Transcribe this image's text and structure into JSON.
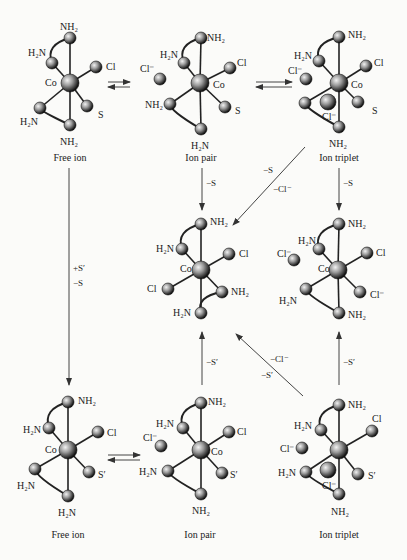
{
  "structures": [
    {
      "id": "top-free-ion",
      "caption": "Free ion",
      "cx": 70,
      "cy": 83,
      "atoms": [
        {
          "label": "NH₂",
          "x": 70,
          "y": 38,
          "lx": 60,
          "ly": 22
        },
        {
          "label": "H₂N",
          "x": 52,
          "y": 63,
          "lx": 28,
          "ly": 48
        },
        {
          "label": "Cl",
          "x": 96,
          "y": 67,
          "lx": 106,
          "ly": 62
        },
        {
          "label": "S",
          "x": 87,
          "y": 106,
          "lx": 98,
          "ly": 110
        },
        {
          "label": "H₂N",
          "x": 40,
          "y": 108,
          "lx": 20,
          "ly": 117
        },
        {
          "label": "NH₂",
          "x": 70,
          "y": 125,
          "lx": 60,
          "ly": 137
        }
      ],
      "center_label": {
        "text": "Co",
        "x": 45,
        "y": 78
      },
      "ion": null
    },
    {
      "id": "top-ion-pair",
      "caption": "Ion pair",
      "cx": 200,
      "cy": 83,
      "atoms": [
        {
          "label": "NH₂",
          "x": 201,
          "y": 38,
          "lx": 207,
          "ly": 33
        },
        {
          "label": "H₂N",
          "x": 184,
          "y": 63,
          "lx": 160,
          "ly": 50
        },
        {
          "label": "Cl",
          "x": 230,
          "y": 68,
          "lx": 237,
          "ly": 58
        },
        {
          "label": "S",
          "x": 225,
          "y": 107,
          "lx": 235,
          "ly": 106
        },
        {
          "label": "NH₂",
          "x": 170,
          "y": 104,
          "lx": 145,
          "ly": 100
        },
        {
          "label": "H₂N",
          "x": 201,
          "y": 129,
          "lx": 191,
          "ly": 141
        }
      ],
      "center_label": {
        "text": "Co",
        "x": 213,
        "y": 80
      },
      "ion": {
        "label": "Cl⁻",
        "x": 160,
        "y": 79,
        "lx": 140,
        "ly": 64
      }
    },
    {
      "id": "top-ion-triplet",
      "caption": "Ion triplet",
      "cx": 339,
      "cy": 83,
      "atoms": [
        {
          "label": "NH₂",
          "x": 339,
          "y": 37,
          "lx": 348,
          "ly": 30
        },
        {
          "label": "H₂N",
          "x": 319,
          "y": 61,
          "lx": 294,
          "ly": 51
        },
        {
          "label": "Cl",
          "x": 366,
          "y": 66,
          "lx": 374,
          "ly": 58
        },
        {
          "label": "S",
          "x": 358,
          "y": 102,
          "lx": 372,
          "ly": 106
        },
        {
          "label": "",
          "x": 305,
          "y": 103,
          "lx": 0,
          "ly": 0
        },
        {
          "label": "NH₂",
          "x": 339,
          "y": 127,
          "lx": 329,
          "ly": 139
        }
      ],
      "center_label": {
        "text": "Co",
        "x": 351,
        "y": 80
      },
      "ion": {
        "label": "Cl⁻",
        "x": 306,
        "y": 79,
        "lx": 288,
        "ly": 66
      },
      "ion2": {
        "label": "Cl⁻",
        "x": 328,
        "y": 102,
        "lx": 322,
        "ly": 112
      }
    },
    {
      "id": "middle-dichloro",
      "caption": "",
      "cx": 201,
      "cy": 270,
      "atoms": [
        {
          "label": "NH₂",
          "x": 201,
          "y": 224,
          "lx": 210,
          "ly": 217
        },
        {
          "label": "H₂N",
          "x": 182,
          "y": 249,
          "lx": 156,
          "ly": 244
        },
        {
          "label": "Cl",
          "x": 229,
          "y": 254,
          "lx": 239,
          "ly": 249
        },
        {
          "label": "Cl",
          "x": 168,
          "y": 289,
          "lx": 147,
          "ly": 284
        },
        {
          "label": "NH₂",
          "x": 222,
          "y": 292,
          "lx": 231,
          "ly": 287
        },
        {
          "label": "H₂N",
          "x": 201,
          "y": 313,
          "lx": 173,
          "ly": 308
        }
      ],
      "center_label": {
        "text": "Co",
        "x": 180,
        "y": 264
      },
      "ion": null
    },
    {
      "id": "middle-right-ion-pair",
      "caption": "",
      "cx": 338,
      "cy": 270,
      "atoms": [
        {
          "label": "NH₂",
          "x": 339,
          "y": 224,
          "lx": 348,
          "ly": 219
        },
        {
          "label": "H₂N",
          "x": 319,
          "y": 249,
          "lx": 298,
          "ly": 236
        },
        {
          "label": "Cl",
          "x": 367,
          "y": 253,
          "lx": 376,
          "ly": 248
        },
        {
          "label": "Cl⁻",
          "x": 360,
          "y": 292,
          "lx": 370,
          "ly": 290
        },
        {
          "label": "H₂N",
          "x": 306,
          "y": 289,
          "lx": 279,
          "ly": 296
        },
        {
          "label": "NH₂",
          "x": 339,
          "y": 313,
          "lx": 348,
          "ly": 310
        }
      ],
      "center_label": {
        "text": "Co",
        "x": 318,
        "y": 264
      },
      "ion": {
        "label": "Cl⁻",
        "x": 294,
        "y": 260,
        "lx": 277,
        "ly": 249
      }
    },
    {
      "id": "bottom-free-ion",
      "caption": "Free ion",
      "cx": 68,
      "cy": 450,
      "atoms": [
        {
          "label": "NH₂",
          "x": 68,
          "y": 402,
          "lx": 78,
          "ly": 396
        },
        {
          "label": "H₂N",
          "x": 49,
          "y": 428,
          "lx": 23,
          "ly": 425
        },
        {
          "label": "Cl",
          "x": 98,
          "y": 432,
          "lx": 107,
          "ly": 428
        },
        {
          "label": "S′",
          "x": 89,
          "y": 472,
          "lx": 98,
          "ly": 470
        },
        {
          "label": "H₂N",
          "x": 35,
          "y": 469,
          "lx": 17,
          "ly": 481
        },
        {
          "label": "H₂N",
          "x": 68,
          "y": 496,
          "lx": 58,
          "ly": 508
        }
      ],
      "center_label": {
        "text": "Co",
        "x": 45,
        "y": 445
      },
      "ion": null
    },
    {
      "id": "bottom-ion-pair",
      "caption": "Ion pair",
      "cx": 201,
      "cy": 450,
      "atoms": [
        {
          "label": "NH₂",
          "x": 201,
          "y": 403,
          "lx": 208,
          "ly": 397
        },
        {
          "label": "H₂N",
          "x": 183,
          "y": 428,
          "lx": 156,
          "ly": 419
        },
        {
          "label": "Cl",
          "x": 229,
          "y": 432,
          "lx": 237,
          "ly": 427
        },
        {
          "label": "S′",
          "x": 222,
          "y": 473,
          "lx": 230,
          "ly": 470
        },
        {
          "label": "H₂N",
          "x": 168,
          "y": 471,
          "lx": 139,
          "ly": 467
        },
        {
          "label": "NH₂",
          "x": 201,
          "y": 494,
          "lx": 192,
          "ly": 506
        }
      ],
      "center_label": {
        "text": "Co",
        "x": 211,
        "y": 447
      },
      "ion": {
        "label": "Cl⁻",
        "x": 161,
        "y": 446,
        "lx": 143,
        "ly": 433
      }
    },
    {
      "id": "bottom-ion-triplet",
      "caption": "Ion triplet",
      "cx": 339,
      "cy": 450,
      "atoms": [
        {
          "label": "NH₂",
          "x": 339,
          "y": 405,
          "lx": 348,
          "ly": 400
        },
        {
          "label": "H₂N",
          "x": 321,
          "y": 430,
          "lx": 294,
          "ly": 421
        },
        {
          "label": "Cl",
          "x": 372,
          "y": 431,
          "lx": 372,
          "ly": 414
        },
        {
          "label": "S′",
          "x": 358,
          "y": 474,
          "lx": 368,
          "ly": 471
        },
        {
          "label": "H₂N",
          "x": 306,
          "y": 472,
          "lx": 278,
          "ly": 468
        },
        {
          "label": "NH₂",
          "x": 339,
          "y": 494,
          "lx": 331,
          "ly": 507
        }
      ],
      "center_label": {
        "text": "",
        "x": 0,
        "y": 0
      },
      "ion": {
        "label": "Cl⁻",
        "x": 302,
        "y": 448,
        "lx": 280,
        "ly": 444
      },
      "ion2": {
        "label": "Cl⁻",
        "x": 328,
        "y": 470,
        "lx": 322,
        "ly": 481
      }
    }
  ],
  "captions": {
    "top_free_ion": "Free ion",
    "top_ion_pair": "Ion pair",
    "top_ion_triplet": "Ion triplet",
    "bottom_free_ion": "Free ion",
    "bottom_ion_pair": "Ion pair",
    "bottom_ion_triplet": "Ion triplet"
  },
  "arrows": {
    "top_pair_left_label": "",
    "left_vertical_plus": "+S′",
    "left_vertical_minus": "−S",
    "top_pair_down": "−S",
    "top_triplet_down": "−S",
    "diag_top_s": "−S",
    "diag_top_cl": "−Cl⁻",
    "bottom_pair_up": "−S′",
    "bottom_triplet_up": "−S′",
    "diag_bottom_cl": "−Cl⁻",
    "diag_bottom_s": "−S′"
  }
}
